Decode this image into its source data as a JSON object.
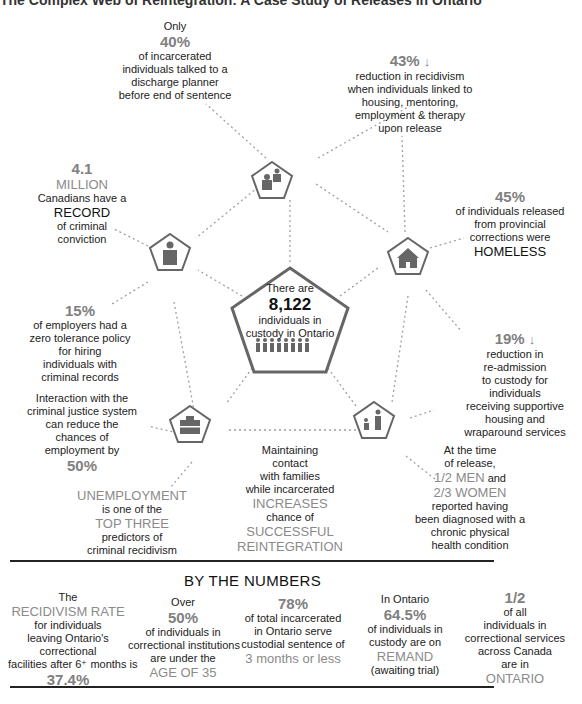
{
  "title": "The Complex Web of Reintegration: A Case Study of Releases in Ontario",
  "colors": {
    "accent_gray": "#8a8a8a",
    "icon_gray": "#666666",
    "arrow_gray": "#999999",
    "text": "#222222"
  },
  "center": {
    "icon": "people-row-icon",
    "line1": "There are",
    "number": "8,122",
    "line2": "individuals in",
    "line3": "custody in Ontario"
  },
  "nodes": {
    "top": {
      "icon": "discharge-planner-icon"
    },
    "left": {
      "icon": "prisoner-icon"
    },
    "right": {
      "icon": "house-icon"
    },
    "bottom_left": {
      "icon": "briefcase-icon"
    },
    "bottom_right": {
      "icon": "family-icon"
    }
  },
  "facts": {
    "discharge": {
      "pre": "Only",
      "stat": "40%",
      "lines": [
        "of incarcerated",
        "individuals talked to a",
        "discharge planner",
        "before end of sentence"
      ]
    },
    "housing_support": {
      "stat": "43%",
      "arrow": "↓",
      "lines": [
        "reduction in recidivism",
        "when individuals linked to",
        "housing, mentoring,",
        "employment & therapy",
        "upon release"
      ]
    },
    "record": {
      "stat": "4.1",
      "unit": "MILLION",
      "line1": "Canadians have a",
      "emph": "RECORD",
      "lines": [
        "of criminal",
        "conviction"
      ]
    },
    "homeless": {
      "stat": "45%",
      "lines": [
        "of individuals released",
        "from provincial",
        "corrections were"
      ],
      "emph": "HOMELESS"
    },
    "employers": {
      "stat": "15%",
      "lines": [
        "of employers had a",
        "zero tolerance policy",
        "for hiring",
        "individuals with",
        "criminal records"
      ]
    },
    "readmission": {
      "stat": "19%",
      "arrow": "↓",
      "lines": [
        "reduction in",
        "re-admission",
        "to custody for",
        "individuals",
        "receiving supportive",
        "housing and",
        "wraparound services"
      ]
    },
    "employment_chance": {
      "lines": [
        "Interaction with the",
        "criminal justice system",
        "can reduce the",
        "chances of",
        "employment by"
      ],
      "stat": "50%"
    },
    "unemployment": {
      "emph1": "UNEMPLOYMENT",
      "line1": "is one of the",
      "emph2": "TOP THREE",
      "lines": [
        "predictors of",
        "criminal recidivism"
      ]
    },
    "families": {
      "lines": [
        "Maintaining",
        "contact",
        "with families",
        "while incarcerated"
      ],
      "emph1": "INCREASES",
      "line2": "chance of",
      "emph2": "SUCCESSFUL",
      "emph3": "REINTEGRATION"
    },
    "health": {
      "lines": [
        "At the time",
        "of release,"
      ],
      "emph1": "1/2 MEN",
      "and": " and",
      "emph2": "2/3 WOMEN",
      "lines2": [
        "reported having",
        "been diagnosed with a",
        "chronic physical",
        "health condition"
      ]
    }
  },
  "by_the_numbers": {
    "heading": "BY THE NUMBERS",
    "items": [
      {
        "pre": "The",
        "emph": "RECIDIVISM RATE",
        "lines": [
          "for individuals",
          "leaving Ontario's",
          "correctional",
          "facilities after 6⁺ months is"
        ],
        "stat": "37.4%"
      },
      {
        "pre": "Over",
        "stat": "50%",
        "lines": [
          "of individuals in",
          "correctional institutions",
          "are under the"
        ],
        "emph": "AGE OF 35"
      },
      {
        "stat": "78%",
        "lines": [
          "of total incarcerated",
          "in Ontario serve",
          "custodial sentence of"
        ],
        "emph": "3 months or less"
      },
      {
        "pre": "In Ontario",
        "stat": "64.5%",
        "lines": [
          "of individuals in",
          "custody are on"
        ],
        "emph": "REMAND",
        "post": "(awaiting trial)"
      },
      {
        "stat": "1/2",
        "lines": [
          "of all",
          "individuals in",
          "correctional services",
          "across Canada",
          "are in"
        ],
        "emph": "ONTARIO"
      }
    ]
  }
}
